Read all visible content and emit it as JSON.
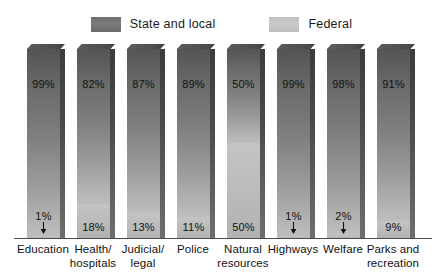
{
  "legend": {
    "entries": [
      {
        "label": "State and local",
        "color": "#6e6e6e",
        "key": "state"
      },
      {
        "label": "Federal",
        "color": "#c4c4c4",
        "key": "federal"
      }
    ]
  },
  "chart_data": {
    "type": "bar",
    "title": "",
    "subtitle": "",
    "xlabel": "",
    "ylabel": "",
    "ylim": [
      0,
      100
    ],
    "grid": false,
    "stacked": true,
    "legend_position": "top-center",
    "categories": [
      "Education",
      "Health/ hospitals",
      "Judicial/ legal",
      "Police",
      "Natural resources",
      "Highways",
      "Welfare",
      "Parks and recreation"
    ],
    "category_lines": [
      [
        "Education"
      ],
      [
        "Health/",
        "hospitals"
      ],
      [
        "Judicial/",
        "legal"
      ],
      [
        "Police"
      ],
      [
        "Natural",
        "resources"
      ],
      [
        "Highways"
      ],
      [
        "Welfare"
      ],
      [
        "Parks and",
        "recreation"
      ]
    ],
    "series": [
      {
        "name": "State and local",
        "values": [
          99,
          82,
          87,
          89,
          50,
          99,
          98,
          91
        ],
        "labels": [
          "99%",
          "82%",
          "87%",
          "89%",
          "50%",
          "99%",
          "98%",
          "91%"
        ]
      },
      {
        "name": "Federal",
        "values": [
          1,
          18,
          13,
          11,
          50,
          1,
          2,
          9
        ],
        "labels": [
          "1%",
          "18%",
          "13%",
          "11%",
          "50%",
          "1%",
          "2%",
          "9%"
        ],
        "label_has_arrow": [
          true,
          false,
          false,
          false,
          false,
          true,
          true,
          false
        ]
      }
    ]
  }
}
